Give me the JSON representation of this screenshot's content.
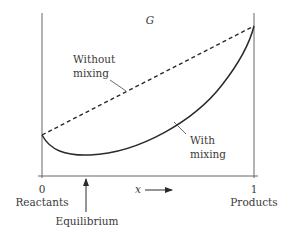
{
  "diagram": {
    "y_label": "G",
    "x_label": "x",
    "x_ticks": [
      {
        "value": "0",
        "caption": "Reactants"
      },
      {
        "value": "1",
        "caption": "Products"
      }
    ],
    "curves": [
      {
        "name": "Without mixing",
        "line1": "Without",
        "line2": "mixing",
        "style": "dashed"
      },
      {
        "name": "With mixing",
        "line1": "With",
        "line2": "mixing",
        "style": "solid"
      }
    ],
    "marker": {
      "label": "Equilibrium"
    },
    "colors": {
      "line": "#2a2a2a",
      "axis": "#555555",
      "text": "#3a3a3a"
    }
  }
}
